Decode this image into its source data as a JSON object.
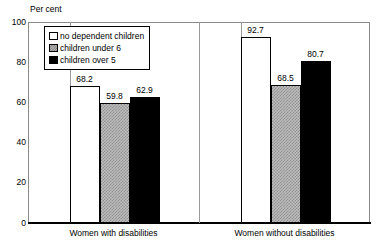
{
  "chart_data": {
    "type": "bar",
    "title": "",
    "subtitle": "",
    "ylabel": "Per cent",
    "xlabel": "",
    "ylim": [
      0,
      100
    ],
    "yticks": [
      0,
      20,
      40,
      60,
      80,
      100
    ],
    "grid": false,
    "legend_position": "inside-top-left",
    "categories": [
      "Women with disabilities",
      "Women without disabilities"
    ],
    "series": [
      {
        "name": "no dependent children",
        "fill": "white",
        "values": [
          68.2,
          92.7
        ],
        "labels": [
          "68.2",
          "92.7"
        ]
      },
      {
        "name": "children under 6",
        "fill": "hatch",
        "values": [
          59.8,
          68.5
        ],
        "labels": [
          "59.8",
          "68.5"
        ]
      },
      {
        "name": "children over 5",
        "fill": "black",
        "values": [
          62.9,
          80.7
        ],
        "labels": [
          "62.9",
          "80.7"
        ]
      }
    ]
  },
  "axis": {
    "y_title": "Per cent",
    "y_tick_labels": [
      "100",
      "80",
      "60",
      "40",
      "20",
      "0"
    ]
  },
  "legend": {
    "items": [
      {
        "label": "no dependent children",
        "swatch": "legend-swatch-white"
      },
      {
        "label": "children under 6",
        "swatch": "legend-swatch-hatched"
      },
      {
        "label": "children over 5",
        "swatch": "legend-swatch-black"
      }
    ]
  },
  "colors": {
    "bar_white": "#ffffff",
    "bar_hatch": "#bdbdbd",
    "bar_black": "#000000",
    "frame": "#8a8a8a",
    "axis": "#000000",
    "text": "#000000"
  }
}
